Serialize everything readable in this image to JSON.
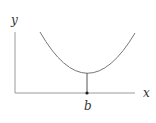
{
  "diagram": {
    "axes": {
      "x_label": "x",
      "y_label": "y"
    },
    "curve": {
      "shape": "upward parabola",
      "minimum_at": "b"
    },
    "marker_label": "b",
    "colors": {
      "axis": "#999999",
      "curve": "#777777",
      "marker": "#333333",
      "text": "#333333"
    }
  }
}
